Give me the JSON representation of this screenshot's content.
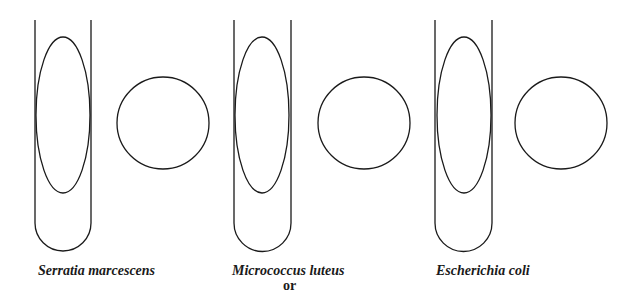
{
  "diagram": {
    "type": "organism-sketch-worksheet",
    "stroke_color": "#1a1a1a",
    "background": "#ffffff",
    "groups": [
      {
        "label": "Serratia marcescens",
        "tube": {
          "x_left": 35,
          "x_right": 91,
          "top": 20,
          "bottom": 251
        },
        "oval": {
          "cx": 63,
          "cy": 115,
          "rx": 27,
          "ry": 78
        },
        "circle": {
          "cx": 163,
          "cy": 123,
          "r": 46
        }
      },
      {
        "label": "Micrococcus luteus",
        "sublabel": "or",
        "tube": {
          "x_left": 234,
          "x_right": 291,
          "top": 20,
          "bottom": 251
        },
        "oval": {
          "cx": 262,
          "cy": 115,
          "rx": 27,
          "ry": 78
        },
        "circle": {
          "cx": 364,
          "cy": 123,
          "r": 46
        }
      },
      {
        "label": "Escherichia coli",
        "tube": {
          "x_left": 435,
          "x_right": 492,
          "top": 20,
          "bottom": 251
        },
        "oval": {
          "cx": 464,
          "cy": 115,
          "rx": 27,
          "ry": 78
        },
        "circle": {
          "cx": 561,
          "cy": 123,
          "r": 46
        }
      }
    ]
  }
}
